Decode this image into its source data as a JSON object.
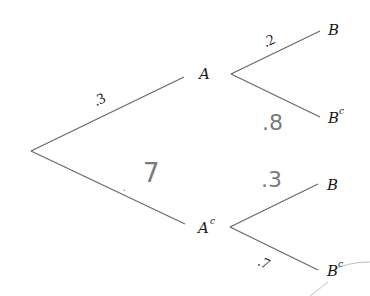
{
  "diagram": {
    "type": "probability-tree",
    "root": {
      "x": 31,
      "y": 151
    },
    "level1": [
      {
        "id": "A",
        "label": "A",
        "superscript": "",
        "prob": ".3",
        "prob_style": "printed"
      },
      {
        "id": "Ac",
        "label": "A",
        "superscript": "c",
        "prob": "7",
        "prob_prefix": ".",
        "prob_style": "handwritten"
      }
    ],
    "level2": {
      "A": [
        {
          "id": "A_B",
          "label": "B",
          "superscript": "",
          "prob": ".2",
          "prob_style": "printed"
        },
        {
          "id": "A_Bc",
          "label": "B",
          "superscript": "c",
          "prob": ".8",
          "prob_style": "handwritten"
        }
      ],
      "Ac": [
        {
          "id": "Ac_B",
          "label": "B",
          "superscript": "",
          "prob": ".3",
          "prob_style": "handwritten"
        },
        {
          "id": "Ac_Bc",
          "label": "B",
          "superscript": "c",
          "prob": ".7",
          "prob_style": "printed"
        }
      ]
    },
    "colors": {
      "line": "#6a6a6a",
      "text": "#1a1a1a",
      "handwriting": "#7a7a7a"
    }
  }
}
